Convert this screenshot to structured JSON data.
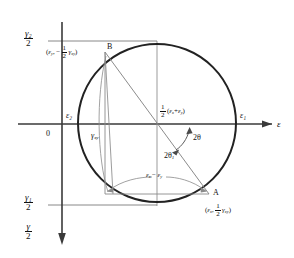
{
  "figure": {
    "type": "mohrs-circle-strain",
    "axes": {
      "horizontal_axis_label": "ε",
      "vertical_axis_label_num": "γ",
      "vertical_axis_label_den": "2",
      "origin_label": "0"
    },
    "axis_ticks": {
      "gamma2_num": "γ₂",
      "gamma2_den": "2",
      "gamma1_num": "γ₁",
      "gamma1_den": "2",
      "epsilon1": "ε₁",
      "epsilon2": "ε₂"
    },
    "points": {
      "A_letter": "A",
      "A_coords_open": "(",
      "A_eps": "ε",
      "A_eps_sub": "x",
      "A_comma": ",",
      "A_frac_num": "1",
      "A_frac_den": "2",
      "A_gamma": "γ",
      "A_gamma_sub": "xy",
      "A_close": ")",
      "B_letter": "B",
      "B_open": "(",
      "B_eps": "ε",
      "B_eps_sub": "y",
      "B_comma": ",",
      "B_minus": "−",
      "B_frac_num": "1",
      "B_frac_den": "2",
      "B_gamma": "γ",
      "B_gamma_sub": "xy",
      "B_close": ")"
    },
    "annotations": {
      "center_frac_num": "1",
      "center_frac_den": "2",
      "center_expr_open": "(",
      "center_eps_x": "ε",
      "center_eps_x_sub": "x",
      "center_plus": "+",
      "center_eps_y": "ε",
      "center_eps_y_sub": "y",
      "center_expr_close": ")",
      "gamma_xy": "γ",
      "gamma_xy_sub": "xy",
      "diff_eps_x": "ε",
      "diff_eps_x_sub": "x",
      "diff_minus": "−",
      "diff_eps_y": "ε",
      "diff_eps_y_sub": "y",
      "two_theta": "2θ",
      "two_theta_1": "2θ",
      "two_theta_1_sub": "1"
    },
    "geometry": {
      "circle_center_x": 157,
      "circle_center_y": 123,
      "circle_radius": 79,
      "axis_x": 62,
      "axis_y": 124,
      "point_A_x": 209,
      "point_A_y": 194,
      "point_B_x": 105,
      "point_B_y": 52
    },
    "colors": {
      "ink": "#1a1a1a",
      "circle_stroke": "#222222",
      "thin_line": "#6a6a6a",
      "background": "#ffffff"
    }
  }
}
